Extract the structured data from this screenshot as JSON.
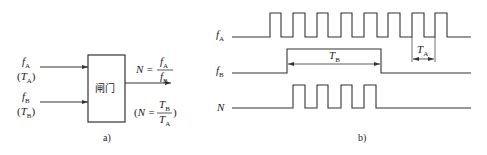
{
  "part_a": {
    "caption": "a)",
    "gate_label": "闸门",
    "input_A": {
      "main": "f",
      "sub": "A",
      "alt_open": "(",
      "alt_main": "T",
      "alt_sub": "A",
      "alt_close": ")"
    },
    "input_B": {
      "main": "f",
      "sub": "B",
      "alt_open": "(",
      "alt_main": "T",
      "alt_sub": "B",
      "alt_close": ")"
    },
    "output_formula": {
      "lhs": "N =",
      "num_main": "f",
      "num_sub": "A",
      "den_main": "f",
      "den_sub": "B"
    },
    "output_formula_alt": {
      "open": "(",
      "lhs": "N =",
      "num_main": "T",
      "num_sub": "B",
      "den_main": "T",
      "den_sub": "A",
      "close": ")"
    }
  },
  "part_b": {
    "caption": "b)",
    "signals": [
      {
        "main": "f",
        "sub": "A"
      },
      {
        "main": "f",
        "sub": "B"
      },
      {
        "main": "N",
        "sub": ""
      }
    ],
    "dimension_TB": {
      "main": "T",
      "sub": "B"
    },
    "dimension_TA": {
      "main": "T",
      "sub": "A"
    }
  },
  "colors": {
    "line": "#333333",
    "background": "#ffffff"
  }
}
